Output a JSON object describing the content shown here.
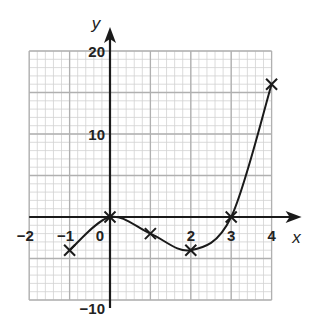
{
  "chart_data": {
    "type": "line",
    "title": "",
    "xlabel": "x",
    "ylabel": "y",
    "xlim": [
      -2,
      4
    ],
    "ylim": [
      -10,
      20
    ],
    "grid": true,
    "x_ticks": [
      -2,
      -1,
      0,
      2,
      3,
      4
    ],
    "x_tick_labels": [
      "-2",
      "-1",
      "0",
      "2",
      "3",
      "4"
    ],
    "y_ticks": [
      20,
      10,
      -10
    ],
    "y_tick_labels": [
      "20",
      "10",
      "-10"
    ],
    "series": [
      {
        "name": "curve",
        "points": [
          [
            -1,
            -4
          ],
          [
            0,
            0
          ],
          [
            1,
            -2
          ],
          [
            2,
            -4
          ],
          [
            3,
            0
          ],
          [
            4,
            16
          ]
        ],
        "marker": "x",
        "smooth": true
      }
    ],
    "colors": {
      "grid_major": "#b0b0b0",
      "grid_minor": "#d2d2d2",
      "axis": "#1a1a1a",
      "curve": "#1a1a1a"
    }
  }
}
